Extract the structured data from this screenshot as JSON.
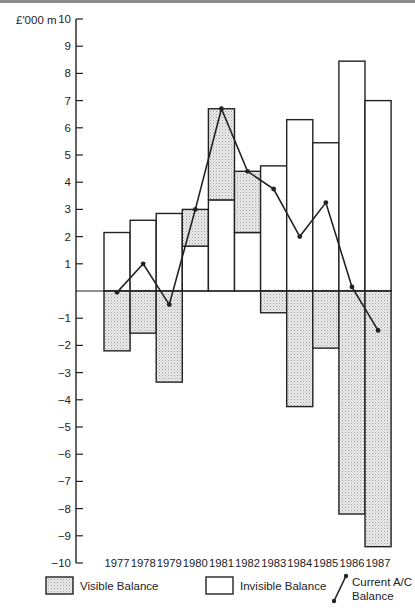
{
  "chart_data": {
    "type": "bar",
    "title": "",
    "ylabel": "£'000 m",
    "xlabel": "",
    "ylim": [
      -10,
      10
    ],
    "yticks": [
      10,
      9,
      8,
      7,
      6,
      5,
      4,
      3,
      2,
      1,
      -1,
      -2,
      -3,
      -4,
      -5,
      -6,
      -7,
      -8,
      -9,
      -10
    ],
    "ytick_labels": [
      "10",
      "9",
      "8",
      "7",
      "6",
      "5",
      "4",
      "3",
      "2",
      "1",
      "-1",
      "-2",
      "-3",
      "-4",
      "-5",
      "-6",
      "-7",
      "-8",
      "-9",
      "-10"
    ],
    "categories": [
      "1977",
      "1978",
      "1979",
      "1980",
      "1981",
      "1982",
      "1983",
      "1984",
      "1985",
      "1986",
      "1987"
    ],
    "series": [
      {
        "name": "Visible Balance",
        "type": "bar",
        "style": "stippled",
        "values": [
          -2.2,
          -1.55,
          -3.35,
          1.35,
          3.35,
          2.25,
          -0.8,
          -4.25,
          -2.1,
          -8.2,
          -9.4
        ]
      },
      {
        "name": "Invisible Balance",
        "type": "bar",
        "style": "outline",
        "values": [
          2.15,
          2.6,
          2.85,
          1.65,
          3.35,
          2.15,
          4.6,
          6.3,
          5.45,
          8.45,
          7.0
        ]
      },
      {
        "name": "Current A/C Balance",
        "type": "line",
        "values": [
          -0.05,
          1.0,
          -0.5,
          3.0,
          6.7,
          4.4,
          3.75,
          2.0,
          3.25,
          0.15,
          -1.45
        ]
      }
    ],
    "legend": {
      "position": "bottom",
      "entries": [
        {
          "label": "Visible Balance",
          "symbol": "stippled-box"
        },
        {
          "label": "Invisible Balance",
          "symbol": "empty-box"
        },
        {
          "label_lines": [
            "Current A/C",
            "Balance"
          ],
          "symbol": "line-with-dots"
        }
      ]
    },
    "grid": false,
    "colors": {
      "ink": "#222222",
      "stipple": "#cfcfcf",
      "background": "#ffffff"
    }
  }
}
